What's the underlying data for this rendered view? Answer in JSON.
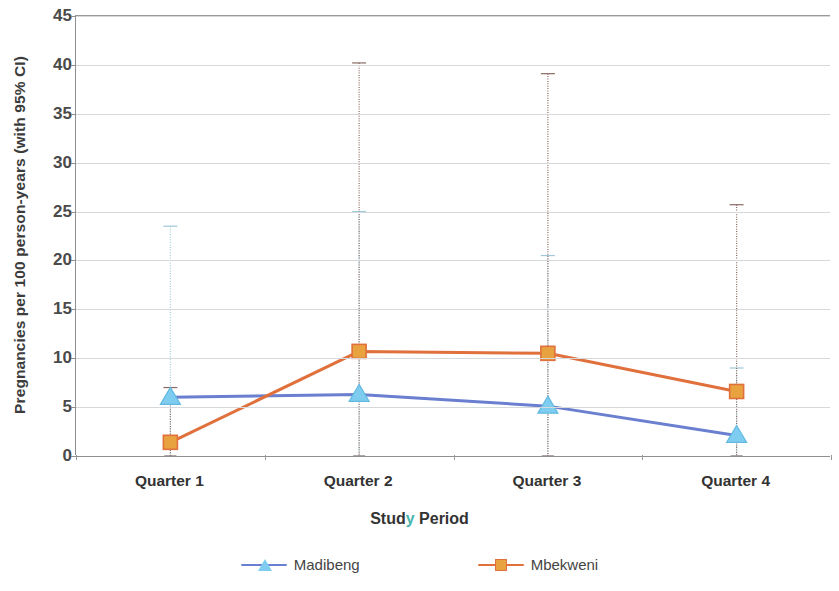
{
  "chart_data": {
    "type": "line",
    "title": "",
    "xlabel": "Study Period",
    "ylabel": "Pregnancies per 100 person-years (with 95% CI)",
    "categories": [
      "Quarter 1",
      "Quarter 2",
      "Quarter 3",
      "Quarter 4"
    ],
    "ylim": [
      0,
      45
    ],
    "yticks": [
      0,
      5,
      10,
      15,
      20,
      25,
      30,
      35,
      40,
      45
    ],
    "grid": true,
    "legend_position": "bottom",
    "error_bars": "95% CI",
    "series": [
      {
        "name": "Madibeng",
        "color": "#6a7fd0",
        "marker": "star",
        "marker_color": "#7ecdf0",
        "values": [
          6.0,
          6.3,
          5.1,
          2.1
        ],
        "ci_lower": [
          0.0,
          0.0,
          0.0,
          0.0
        ],
        "ci_upper": [
          23.5,
          25.0,
          20.5,
          9.0
        ]
      },
      {
        "name": "Mbekweni",
        "color": "#e0703c",
        "marker": "square",
        "marker_color": "#e8a340",
        "values": [
          1.4,
          10.7,
          10.5,
          6.6
        ],
        "ci_lower": [
          0.0,
          0.0,
          0.0,
          0.0
        ],
        "ci_upper": [
          7.0,
          40.2,
          39.1,
          25.7
        ]
      }
    ]
  },
  "axis": {
    "y_tick_labels": [
      "45",
      "40",
      "35",
      "30",
      "25",
      "20",
      "15",
      "10",
      "5",
      "0"
    ]
  },
  "xlabel_parts": {
    "before": "Stud",
    "artifact": "y",
    "after": " Period"
  }
}
